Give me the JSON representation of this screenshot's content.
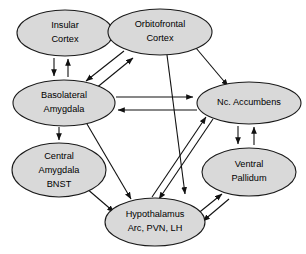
{
  "diagram": {
    "background_color": "#ffffff",
    "node_fill_color": "#d9d9d9",
    "node_stroke_color": "#1a1a1a",
    "edge_color": "#111111",
    "nodes": [
      {
        "id": "insular-cortex",
        "lines": [
          "Insular",
          "Cortex"
        ],
        "cx": 65,
        "cy": 33,
        "rx": 48,
        "ry": 23
      },
      {
        "id": "orbitofrontal-cortex",
        "lines": [
          "Orbitofrontal",
          "Cortex"
        ],
        "cx": 160,
        "cy": 32,
        "rx": 52,
        "ry": 23
      },
      {
        "id": "basolateral-amygdala",
        "lines": [
          "Basolateral",
          "Amygdala"
        ],
        "cx": 64,
        "cy": 103,
        "rx": 51,
        "ry": 23
      },
      {
        "id": "nc-accumbens",
        "lines": [
          "Nc. Accumbens"
        ],
        "cx": 249,
        "cy": 103,
        "rx": 52,
        "ry": 21
      },
      {
        "id": "central-amygdala-bnst",
        "lines": [
          "Central",
          "Amygdala",
          "BNST"
        ],
        "cx": 59,
        "cy": 170,
        "rx": 47,
        "ry": 27
      },
      {
        "id": "ventral-pallidum",
        "lines": [
          "Ventral",
          "Pallidum"
        ],
        "cx": 249,
        "cy": 172,
        "rx": 47,
        "ry": 24
      },
      {
        "id": "hypothalamus",
        "lines": [
          "Hypothalamus",
          "Arc, PVN, LH"
        ],
        "cx": 155,
        "cy": 222,
        "rx": 50,
        "ry": 24
      }
    ],
    "edges": [
      {
        "id": "insular-to-orbitofrontal",
        "from": "insular-cortex",
        "to": "orbitofrontal-cortex",
        "direction": "forward"
      },
      {
        "id": "orbitofrontal-to-insular",
        "from": "orbitofrontal-cortex",
        "to": "insular-cortex",
        "direction": "forward"
      },
      {
        "id": "insular-to-basolateral",
        "from": "insular-cortex",
        "to": "basolateral-amygdala",
        "direction": "forward"
      },
      {
        "id": "basolateral-to-insular",
        "from": "basolateral-amygdala",
        "to": "insular-cortex",
        "direction": "forward"
      },
      {
        "id": "orbitofrontal-to-basolateral",
        "from": "orbitofrontal-cortex",
        "to": "basolateral-amygdala",
        "direction": "forward"
      },
      {
        "id": "basolateral-to-orbitofrontal",
        "from": "basolateral-amygdala",
        "to": "orbitofrontal-cortex",
        "direction": "forward"
      },
      {
        "id": "orbitofrontal-to-nc-accumbens",
        "from": "orbitofrontal-cortex",
        "to": "nc-accumbens",
        "direction": "forward"
      },
      {
        "id": "orbitofrontal-to-hypothalamus",
        "from": "orbitofrontal-cortex",
        "to": "hypothalamus",
        "direction": "forward"
      },
      {
        "id": "basolateral-to-nc-accumbens",
        "from": "basolateral-amygdala",
        "to": "nc-accumbens",
        "direction": "forward"
      },
      {
        "id": "nc-accumbens-to-basolateral",
        "from": "nc-accumbens",
        "to": "basolateral-amygdala",
        "direction": "forward"
      },
      {
        "id": "basolateral-to-central-amygdala",
        "from": "basolateral-amygdala",
        "to": "central-amygdala-bnst",
        "direction": "forward"
      },
      {
        "id": "basolateral-to-hypothalamus",
        "from": "basolateral-amygdala",
        "to": "hypothalamus",
        "direction": "forward"
      },
      {
        "id": "central-amygdala-to-hypothalamus",
        "from": "central-amygdala-bnst",
        "to": "hypothalamus",
        "direction": "forward"
      },
      {
        "id": "nc-accumbens-to-ventral-pallidum",
        "from": "nc-accumbens",
        "to": "ventral-pallidum",
        "direction": "forward"
      },
      {
        "id": "ventral-pallidum-to-nc-accumbens",
        "from": "ventral-pallidum",
        "to": "nc-accumbens",
        "direction": "forward"
      },
      {
        "id": "hypothalamus-to-nc-accumbens",
        "from": "hypothalamus",
        "to": "nc-accumbens",
        "direction": "forward"
      },
      {
        "id": "nc-accumbens-to-hypothalamus",
        "from": "nc-accumbens",
        "to": "hypothalamus",
        "direction": "forward"
      },
      {
        "id": "hypothalamus-to-ventral-pallidum",
        "from": "hypothalamus",
        "to": "ventral-pallidum",
        "direction": "forward"
      },
      {
        "id": "ventral-pallidum-to-hypothalamus",
        "from": "ventral-pallidum",
        "to": "hypothalamus",
        "direction": "forward"
      }
    ]
  }
}
